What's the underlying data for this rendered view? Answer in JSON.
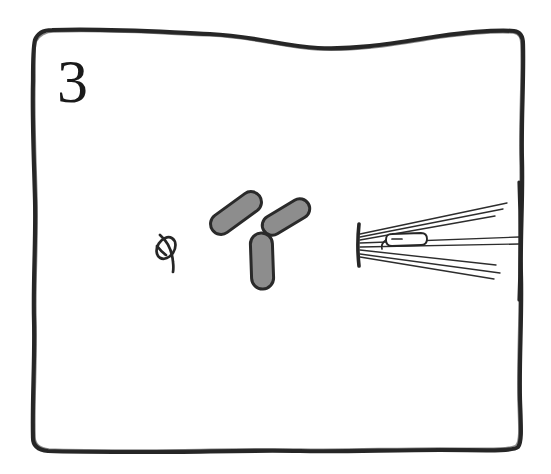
{
  "figure": {
    "panel_label": "3",
    "kind": "hand-drawn-scientific-panel",
    "background_color": "#ffffff",
    "ink_color": "#1f1f1f",
    "fill_gray": "#8d8d8d",
    "width": 551,
    "height": 474
  },
  "frame": {
    "name": "hand-drawn-wavy-border",
    "stroke_color": "#262626",
    "stroke_width": 4,
    "bounds": {
      "left": 28,
      "top": 28,
      "right": 524,
      "bottom": 452
    }
  },
  "elements": {
    "knot": {
      "label": "knot-glyph",
      "description": "small tied loop / slashed circle",
      "center_x": 167,
      "center_y": 248,
      "radius": 11,
      "stroke_color": "#262626",
      "stroke_width": 2.6
    },
    "triskelion": {
      "label": "three-lobed-Y-structure",
      "description": "Y-shaped body with three rounded grey lobes",
      "center_x": 263,
      "center_y": 238,
      "fill_color": "#8d8d8d",
      "stroke_color": "#2a2a2a",
      "stroke_width": 3,
      "lobes": [
        {
          "name": "upper-left-lobe",
          "angle_deg": 210,
          "length": 58,
          "width": 21
        },
        {
          "name": "upper-right-lobe",
          "angle_deg": 330,
          "length": 52,
          "width": 20
        },
        {
          "name": "lower-lobe",
          "angle_deg": 90,
          "length": 56,
          "width": 22
        }
      ]
    },
    "spindle": {
      "label": "spindle-pole-with-microtubules",
      "description": "vertical pole bar at left with fanned microtubule fibers and a chromosome",
      "pole": {
        "name": "spindle-pole-body",
        "x": 359,
        "top_y": 224,
        "bottom_y": 266,
        "stroke_color": "#262626",
        "stroke_width": 3.5
      },
      "fiber_count": 8,
      "fiber_stroke_color": "#2d2d2d",
      "fiber_stroke_width": 1.4,
      "chromosome": {
        "name": "chromosome-capsule",
        "x": 392,
        "y": 238,
        "length": 36,
        "height": 11,
        "stroke_color": "#262626",
        "stroke_width": 1.8
      },
      "right_bar": {
        "name": "right-terminal-bar",
        "x": 519,
        "top_y": 180,
        "bottom_y": 300
      }
    }
  }
}
